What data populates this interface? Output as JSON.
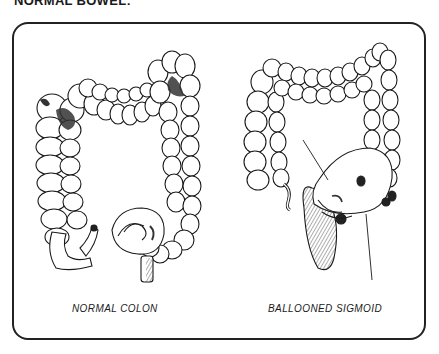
{
  "heading": "NORMAL BOWEL:",
  "figures": [
    {
      "id": "normal",
      "label": "NORMAL COLON"
    },
    {
      "id": "ballooned",
      "label": "BALLOONED SIGMOID"
    }
  ],
  "colors": {
    "ink": "#1a1a1a",
    "background": "#ffffff",
    "shade": "#3a3a3a"
  }
}
